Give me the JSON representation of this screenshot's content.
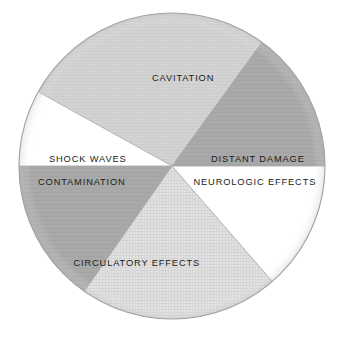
{
  "figure": {
    "caption": "",
    "background_color": "#ffffff"
  },
  "labels": {
    "cavitation": "CAVITATION",
    "distant_damage": "DISTANT DAMAGE",
    "neurologic_effects": "NEUROLOGIC EFFECTS",
    "shock_waves": "SHOCK WAVES",
    "contamination": "CONTAMINATION",
    "circulatory_effects": "CIRCULATORY EFFECTS"
  },
  "chart_data": {
    "type": "pie",
    "title": "",
    "subtitle": "",
    "xlabel": "",
    "ylabel": "",
    "legend_position": "none",
    "grid": false,
    "center": {
      "x": 172,
      "y": 166
    },
    "radius": 153,
    "outline_color": "#9a9a9a",
    "categories": [
      "CAVITATION",
      "DISTANT DAMAGE",
      "NEUROLOGIC EFFECTS",
      "CIRCULATORY EFFECTS",
      "CONTAMINATION",
      "SHOCK WAVES"
    ],
    "values": [
      26.0,
      15.5,
      14.0,
      21.0,
      15.5,
      8.0
    ],
    "slices": [
      {
        "label": "CAVITATION",
        "value": 26.0,
        "start_angle": 299,
        "end_angle": 36,
        "fill": "#d2d2d2",
        "texture": "fine-hatch",
        "label_x": 183,
        "label_y": 78
      },
      {
        "label": "DISTANT DAMAGE",
        "value": 15.5,
        "start_angle": 36,
        "end_angle": 90,
        "fill": "#a9a9a9",
        "texture": "solid",
        "label_x": 258,
        "label_y": 159
      },
      {
        "label": "NEUROLOGIC EFFECTS",
        "value": 14.0,
        "start_angle": 90,
        "end_angle": 139,
        "fill": "#ffffff",
        "texture": "solid",
        "label_x": 255,
        "label_y": 182
      },
      {
        "label": "CIRCULATORY EFFECTS",
        "value": 21.0,
        "start_angle": 139,
        "end_angle": 215,
        "fill": "#dcdcdc",
        "texture": "cross-hatch",
        "label_x": 137,
        "label_y": 263
      },
      {
        "label": "CONTAMINATION",
        "value": 15.5,
        "start_angle": 215,
        "end_angle": 270,
        "fill": "#a9a9a9",
        "texture": "solid",
        "label_x": 82,
        "label_y": 182
      },
      {
        "label": "SHOCK WAVES",
        "value": 8.0,
        "start_angle": 270,
        "end_angle": 299,
        "fill": "#ffffff",
        "texture": "solid",
        "label_x": 88,
        "label_y": 159
      }
    ]
  }
}
